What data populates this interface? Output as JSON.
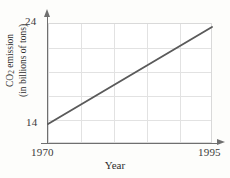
{
  "chart_data": {
    "type": "line",
    "title": "",
    "xlabel": "Year",
    "ylabel": "CO2 emission (in billions of tons)",
    "ylabel_line1": "CO",
    "ylabel_sub": "2",
    "ylabel_line1_rest": " emission",
    "ylabel_line2": "(in billions of tons)",
    "x": [
      1970,
      1995
    ],
    "values": [
      14,
      23.6
    ],
    "series": [
      {
        "name": "CO2 emission",
        "x": [
          1970,
          1995
        ],
        "values": [
          14,
          23.6
        ],
        "color": "#5a5a5a"
      }
    ],
    "xlim": [
      1970,
      1995
    ],
    "ylim": [
      14,
      24
    ],
    "xticks": [
      1970,
      1995
    ],
    "xtick_labels": [
      "1970",
      "1995"
    ],
    "yticks": [
      14,
      24
    ],
    "ytick_labels": [
      "14",
      "24"
    ],
    "grid": true,
    "grid_color": "#e2e2e2",
    "vertical_gridlines": 4,
    "horizontal_gridlines": 4,
    "legend": "none",
    "axis_arrows": true,
    "axis_color": "#6f6f6f",
    "background": "#ffffff"
  },
  "axis": {
    "y_tick_top": "24",
    "y_tick_bottom": "14",
    "x_tick_left": "1970",
    "x_tick_right": "1995",
    "x_title": "Year"
  },
  "icons": {
    "y_axis_arrow": "arrow-up-icon",
    "x_axis_arrow": "arrow-right-icon"
  }
}
